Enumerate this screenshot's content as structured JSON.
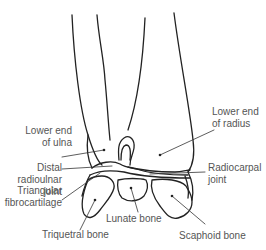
{
  "diagram": {
    "labels": {
      "lower_end_ulna": [
        "Lower end",
        "of ulna"
      ],
      "distal_radioulnar": [
        "Distal",
        "radioulnar",
        "joint"
      ],
      "triangular_fibrocartilage": [
        "Triangular",
        "fibrocartilage"
      ],
      "triquetral": "Triquetral bone",
      "lunate": "Lunate bone",
      "scaphoid": "Scaphoid bone",
      "lower_end_radius": [
        "Lower end",
        "of radius"
      ],
      "radiocarpal": [
        "Radiocarpal",
        "joint"
      ]
    },
    "colors": {
      "line": "#222222",
      "text": "#555555",
      "background": "#ffffff"
    }
  }
}
